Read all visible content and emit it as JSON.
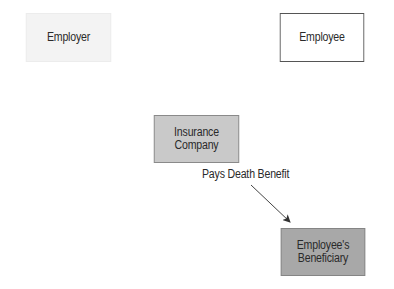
{
  "diagram": {
    "nodes": [
      {
        "id": "employer",
        "lines": [
          "Employer"
        ],
        "fill": "#f3f3f3"
      },
      {
        "id": "employee",
        "lines": [
          "Employee"
        ],
        "fill": "#ffffff"
      },
      {
        "id": "insurer",
        "lines": [
          "Insurance",
          "Company"
        ],
        "fill": "#c9c9c9"
      },
      {
        "id": "beneficiary",
        "lines": [
          "Employee's",
          "Beneficiary"
        ],
        "fill": "#a8a8a8"
      }
    ],
    "edges": [
      {
        "from": "insurer",
        "to": "beneficiary",
        "label": "Pays Death Benefit"
      }
    ]
  }
}
